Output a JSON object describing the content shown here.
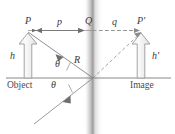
{
  "figure": {
    "type": "optics-ray-diagram",
    "background_color": "#ffffff",
    "stroke_color": "#6e6e6e",
    "text_color": "#3a3a3a",
    "surface_color": "#b8b8b8"
  },
  "labels": {
    "object_point": "P",
    "image_point": "P'",
    "vertex_point": "Q",
    "center_point": "R",
    "object_distance": "p",
    "image_distance": "q",
    "object_height": "h",
    "image_height": "h'",
    "angle_upper": "θ",
    "angle_lower": "θ",
    "object_word": "Object",
    "image_word": "Image"
  },
  "elements": {
    "axis": "horizontal-optical-axis",
    "surface": "vertical-refracting-surface",
    "object_arrow": "object-arrow-up",
    "image_arrow": "image-arrow-up",
    "incident_ray": "ray-from-P-to-R",
    "refracted_ray": "dashed-ray-R-to-P-prime",
    "extended_ray": "ray-extended-below-axis",
    "p_measure": "double-headed-arrow-p",
    "q_measure": "dashed-double-headed-arrow-q"
  },
  "geometry": {
    "axis_y": 78,
    "surface_x": 93,
    "object_x": 28,
    "image_x": 141,
    "top_line_y": 30,
    "arrow_top_y": 33
  }
}
